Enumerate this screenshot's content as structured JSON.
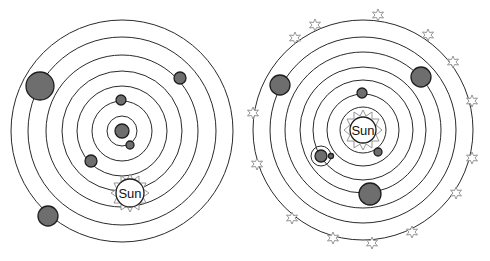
{
  "diagrams": [
    {
      "name": "geocentric-model",
      "center": [
        122,
        131
      ],
      "orbits": [
        15,
        30,
        45,
        60,
        76,
        94,
        111
      ],
      "earth": {
        "x": 122,
        "y": 131,
        "r": 7
      },
      "sun": {
        "x": 130,
        "y": 193,
        "r": 14,
        "label": "Sun"
      },
      "planets": [
        {
          "x": 130,
          "y": 146,
          "r": 4
        },
        {
          "x": 121,
          "y": 99,
          "r": 5
        },
        {
          "x": 91,
          "y": 160,
          "r": 6
        },
        {
          "x": 180,
          "y": 78,
          "r": 6
        },
        {
          "x": 39,
          "y": 86,
          "r": 14
        },
        {
          "x": 48,
          "y": 216,
          "r": 10
        }
      ]
    },
    {
      "name": "heliocentric-model",
      "center": [
        363,
        130
      ],
      "orbits": [
        23,
        36,
        50,
        63,
        78,
        93,
        110
      ],
      "sun": {
        "x": 363,
        "y": 130,
        "r": 14,
        "label": "Sun"
      },
      "planets": [
        {
          "x": 378,
          "y": 152,
          "r": 4
        },
        {
          "x": 362,
          "y": 93,
          "r": 5
        },
        {
          "x": 321,
          "y": 156,
          "r": 6,
          "has_moon_orbit": true
        },
        {
          "x": 370,
          "y": 194,
          "r": 11
        },
        {
          "x": 281,
          "y": 85,
          "r": 10
        },
        {
          "x": 421,
          "y": 77,
          "r": 10
        }
      ],
      "stars_count": 16
    }
  ]
}
